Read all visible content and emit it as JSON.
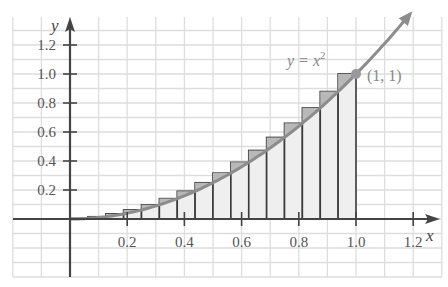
{
  "chart_data": {
    "type": "bar",
    "title": "",
    "function": "y = x^2",
    "curve_label": {
      "prefix": "y = x",
      "exponent": "2"
    },
    "point": {
      "x": 1,
      "y": 1,
      "label": "(1, 1)"
    },
    "xlabel": "x",
    "ylabel": "y",
    "xlim": [
      -0.2,
      1.3
    ],
    "ylim": [
      -0.2,
      1.3
    ],
    "x_ticks": [
      "0.2",
      "0.4",
      "0.6",
      "0.8",
      "1.0",
      "1.2"
    ],
    "x_tick_values": [
      0.2,
      0.4,
      0.6,
      0.8,
      1.0,
      1.2
    ],
    "y_ticks": [
      "0.2",
      "0.4",
      "0.6",
      "0.8",
      "1.0",
      "1.2"
    ],
    "y_tick_values": [
      0.2,
      0.4,
      0.6,
      0.8,
      1.0,
      1.2
    ],
    "grid": true,
    "grid_step": 0.1,
    "n_rectangles": 16,
    "rectangle_width": 0.0625,
    "categories": [
      "0.0625",
      "0.125",
      "0.1875",
      "0.25",
      "0.3125",
      "0.375",
      "0.4375",
      "0.5",
      "0.5625",
      "0.625",
      "0.6875",
      "0.75",
      "0.8125",
      "0.875",
      "0.9375",
      "1.0"
    ],
    "values": [
      0.0039,
      0.0156,
      0.0352,
      0.0625,
      0.0977,
      0.1406,
      0.1914,
      0.25,
      0.3164,
      0.3906,
      0.4727,
      0.5625,
      0.6602,
      0.7656,
      0.8789,
      1.0
    ],
    "colors": {
      "grid": "#dddddd",
      "axis": "#444444",
      "curve": "#8c8c8c",
      "rect_fill": "#efefef",
      "rect_excess": "#b8b8b8",
      "rect_stroke": "#3a3a3a"
    }
  }
}
